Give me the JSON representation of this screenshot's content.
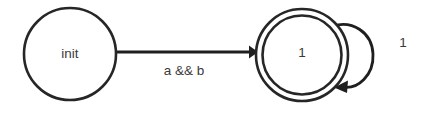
{
  "diagram": {
    "type": "state-machine",
    "width": 432,
    "height": 114,
    "background_color": "#ffffff",
    "stroke_color": "#262626",
    "text_color": "#3a3a3a",
    "states": [
      {
        "id": "init",
        "label": "init",
        "shape": "circle",
        "accepting": false,
        "cx": 70,
        "cy": 54,
        "r": 46
      },
      {
        "id": "s1",
        "label": "1",
        "shape": "double-circle",
        "accepting": true,
        "cx": 302,
        "cy": 55,
        "r_outer": 46,
        "r_inner": 40
      }
    ],
    "transitions": [
      {
        "id": "t-init-to-1",
        "from": "init",
        "to": "s1",
        "label": "a && b",
        "label_x": 184,
        "label_y": 71,
        "kind": "straight"
      },
      {
        "id": "t-1-self",
        "from": "s1",
        "to": "s1",
        "label": "1",
        "label_x": 403,
        "label_y": 43,
        "kind": "self-loop"
      }
    ]
  }
}
